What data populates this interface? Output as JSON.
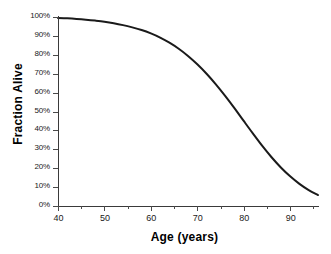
{
  "chart_data": {
    "type": "line",
    "title": "",
    "subtitle": "",
    "xlabel": "Age (years)",
    "ylabel": "Fraction Alive",
    "xlim": [
      40,
      96
    ],
    "ylim": [
      0,
      100
    ],
    "xticks": [
      40,
      50,
      60,
      70,
      80,
      90
    ],
    "xtick_labels": [
      "40",
      "50",
      "60",
      "70",
      "80",
      "90"
    ],
    "xminor_ticks": [
      45,
      55,
      65,
      75,
      85,
      95
    ],
    "yticks": [
      0,
      10,
      20,
      30,
      40,
      50,
      60,
      70,
      80,
      90,
      100
    ],
    "ytick_labels": [
      "0%",
      "10%",
      "20%",
      "30%",
      "40%",
      "50%",
      "60%",
      "70%",
      "80%",
      "90%",
      "100%"
    ],
    "grid": false,
    "legend": false,
    "legend_position": "none",
    "line_color": "#1a1a1a",
    "line_width": 2,
    "background_color": "#ffffff",
    "series": [
      {
        "name": "Fraction Alive",
        "x": [
          40,
          42,
          44,
          46,
          48,
          50,
          52,
          54,
          56,
          58,
          60,
          62,
          64,
          66,
          68,
          70,
          72,
          74,
          76,
          78,
          80,
          82,
          84,
          86,
          88,
          90,
          92,
          94,
          96
        ],
        "values": [
          99.5,
          99.3,
          99.0,
          98.6,
          98.1,
          97.5,
          96.7,
          95.7,
          94.5,
          93.1,
          91.3,
          89.1,
          86.4,
          83.2,
          79.4,
          75.0,
          70.0,
          64.4,
          58.3,
          51.8,
          45.0,
          38.3,
          31.8,
          25.8,
          20.4,
          15.7,
          11.7,
          8.4,
          5.8
        ]
      }
    ],
    "annotations": []
  },
  "axes": {
    "x_title": "Age (years)",
    "y_title": "Fraction Alive"
  }
}
